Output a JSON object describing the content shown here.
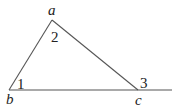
{
  "diagram": {
    "type": "triangle-exterior-angle",
    "vertices": {
      "a": {
        "label": "a",
        "x": 52,
        "y": 20
      },
      "b": {
        "label": "b",
        "x": 9,
        "y": 90
      },
      "c": {
        "label": "c",
        "x": 138,
        "y": 90
      }
    },
    "extension_end": {
      "x": 172,
      "y": 90
    },
    "angle_labels": {
      "angle1": "1",
      "angle2": "2",
      "angle3": "3"
    },
    "stroke_color": "#555555",
    "text_color": "#222222"
  }
}
